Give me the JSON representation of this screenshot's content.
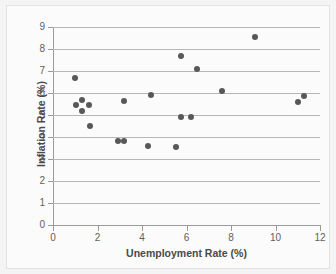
{
  "chart_data": {
    "type": "scatter",
    "title": "",
    "xlabel": "Unemployment Rate (%)",
    "ylabel": "Inflation Rate (%)",
    "xlim": [
      0,
      12
    ],
    "ylim": [
      0,
      9
    ],
    "xticks": [
      0,
      2,
      4,
      6,
      8,
      10,
      12
    ],
    "yticks": [
      0,
      1,
      2,
      3,
      4,
      5,
      6,
      7,
      8,
      9
    ],
    "grid": "horizontal",
    "legend": "none",
    "marker_color": "#58585a",
    "marker_size": 6,
    "series": [
      {
        "name": "observations",
        "points": [
          {
            "x": 1.0,
            "y": 6.7
          },
          {
            "x": 1.05,
            "y": 5.45
          },
          {
            "x": 1.3,
            "y": 5.7
          },
          {
            "x": 1.3,
            "y": 5.2
          },
          {
            "x": 1.6,
            "y": 5.45
          },
          {
            "x": 1.65,
            "y": 4.5
          },
          {
            "x": 2.9,
            "y": 3.8
          },
          {
            "x": 3.2,
            "y": 3.8
          },
          {
            "x": 3.2,
            "y": 5.65
          },
          {
            "x": 4.25,
            "y": 3.6
          },
          {
            "x": 4.4,
            "y": 5.9
          },
          {
            "x": 5.55,
            "y": 3.55
          },
          {
            "x": 5.75,
            "y": 7.7
          },
          {
            "x": 5.75,
            "y": 4.9
          },
          {
            "x": 6.2,
            "y": 4.9
          },
          {
            "x": 6.45,
            "y": 7.1
          },
          {
            "x": 7.6,
            "y": 6.1
          },
          {
            "x": 9.1,
            "y": 8.55
          },
          {
            "x": 11.0,
            "y": 5.6
          },
          {
            "x": 11.3,
            "y": 5.85
          }
        ]
      }
    ]
  },
  "axes": {
    "x_tick_labels": [
      "0",
      "2",
      "4",
      "6",
      "8",
      "10",
      "12"
    ],
    "y_tick_labels": [
      "0",
      "1",
      "2",
      "3",
      "4",
      "5",
      "6",
      "7",
      "8",
      "9"
    ],
    "x_title": "Unemployment Rate (%)",
    "y_title": "Inflation Rate (%)"
  }
}
